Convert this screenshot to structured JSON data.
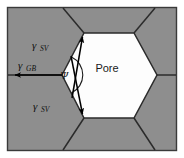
{
  "figure": {
    "frame": {
      "border_color": "#3a3a3a",
      "outer_background": "#ffffff"
    },
    "colors": {
      "grain_fill": "#8e8e8e",
      "pore_fill": "#fdfdfd",
      "boundary_line": "#2b2b2b",
      "arrow": "#000000",
      "text": "#111111"
    },
    "labels": {
      "pore": "Pore",
      "gamma_sv_top": {
        "symbol": "γ",
        "subscript": "SV"
      },
      "gamma_sv_bottom": {
        "symbol": "γ",
        "subscript": "SV"
      },
      "gamma_gb": {
        "symbol": "γ",
        "subscript": "GB"
      },
      "psi": "Ψ"
    },
    "annotations": [
      {
        "name": "gamma-sv-top-vector",
        "meaning": "solid-vapor surface tension, upper pore surface",
        "direction": "up-right along pore wall"
      },
      {
        "name": "gamma-sv-bottom-vector",
        "meaning": "solid-vapor surface tension, lower pore surface",
        "direction": "down-right along pore wall"
      },
      {
        "name": "gamma-gb-vector",
        "meaning": "grain boundary tension",
        "direction": "left, horizontal"
      },
      {
        "name": "psi-arc",
        "meaning": "dihedral angle between the two solid-vapor surfaces"
      }
    ],
    "geometry": {
      "pore_shape": "hexagon",
      "pore_vertices": [
        [
          62,
          75
        ],
        [
          84,
          33
        ],
        [
          134,
          33
        ],
        [
          157,
          75
        ],
        [
          134,
          118
        ],
        [
          84,
          118
        ]
      ],
      "grain_boundaries": [
        "left vertex to left frame edge (horizontal)",
        "upper-left vertex to top frame edge",
        "upper-right vertex to top frame edge",
        "right vertex to right frame edge (horizontal)",
        "lower-right vertex to bottom frame edge",
        "lower-left vertex to bottom frame edge"
      ]
    }
  }
}
